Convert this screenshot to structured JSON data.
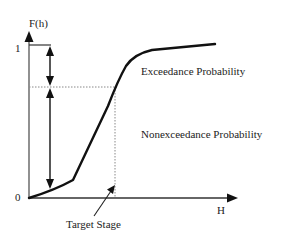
{
  "diagram": {
    "y_axis_label": "F(h)",
    "x_axis_label": "H",
    "y_tick_top": "1",
    "y_tick_origin": "0",
    "exceedance_label": "Exceedance Probability",
    "nonexceedance_label": "Nonexceedance Probability",
    "target_stage_label": "Target Stage",
    "curve_type": "cumulative distribution function",
    "colors": {
      "line": "#111111",
      "dotted": "#888888",
      "background": "#ffffff"
    }
  }
}
